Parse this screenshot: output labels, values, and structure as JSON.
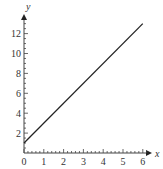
{
  "chart_data": {
    "type": "line",
    "title": "",
    "xlabel": "x",
    "ylabel": "y",
    "xlim": [
      0,
      6.4
    ],
    "ylim": [
      0,
      13.8
    ],
    "x_ticks": [
      "0",
      "1",
      "2",
      "3",
      "4",
      "5",
      "6"
    ],
    "y_ticks": [
      "2",
      "4",
      "6",
      "8",
      "10",
      "12"
    ],
    "grid": false,
    "legend": null,
    "series": [
      {
        "name": "y = 2x + 1",
        "x": [
          0,
          6
        ],
        "y": [
          1,
          13
        ],
        "color": "#222222"
      }
    ]
  }
}
